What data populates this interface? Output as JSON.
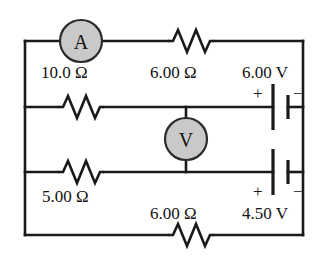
{
  "figure": {
    "type": "circuit-diagram",
    "title": "",
    "background_color": "#ffffff",
    "wire_color": "#1a1a1a",
    "meter_fill_color": "#c9c9c9",
    "text_color": "#121212"
  },
  "meters": {
    "ammeter": {
      "symbol": "A",
      "name": "ammeter"
    },
    "voltmeter": {
      "symbol": "V",
      "name": "voltmeter"
    }
  },
  "resistors": {
    "top_left": {
      "label": "10.0 Ω",
      "value": 10.0,
      "unit": "Ω"
    },
    "top_right": {
      "label": "6.00 Ω",
      "value": 6.0,
      "unit": "Ω"
    },
    "middle_left": {
      "label": "5.00 Ω",
      "value": 5.0,
      "unit": "Ω"
    },
    "bottom": {
      "label": "6.00 Ω",
      "value": 6.0,
      "unit": "Ω"
    }
  },
  "batteries": {
    "upper": {
      "label": "6.00 V",
      "value": 6.0,
      "unit": "V",
      "plus_sign": "+",
      "minus_sign": "−"
    },
    "lower": {
      "label": "4.50 V",
      "value": 4.5,
      "unit": "V",
      "plus_sign": "+",
      "minus_sign": "−"
    }
  }
}
